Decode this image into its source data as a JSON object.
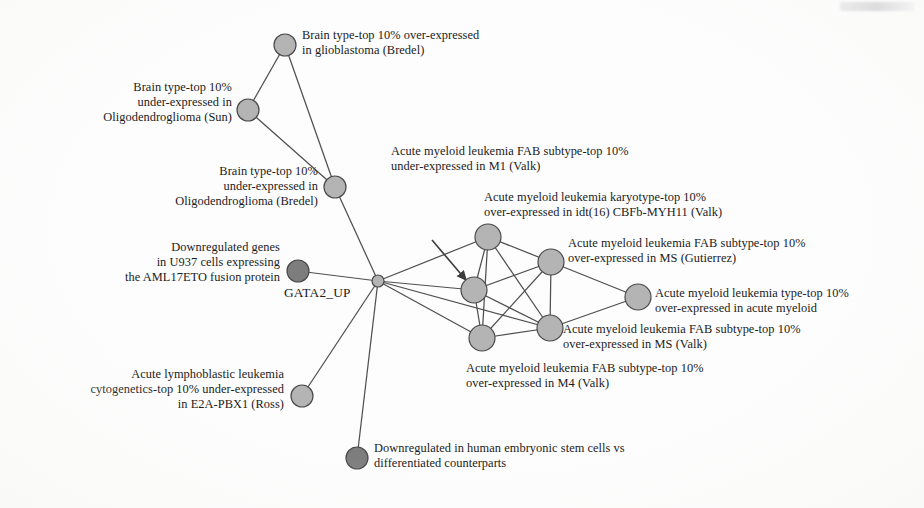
{
  "figure": {
    "type": "network-graph",
    "hub_node_label": "GATA2_UP",
    "colors": {
      "node_light": "#b4b4b4",
      "node_dark": "#7d7d7d",
      "node_stroke": "#4a4a4a",
      "edge": "#4f4f4f",
      "text": "#1b1b1b",
      "background": "#fdfdfd"
    }
  },
  "nodes": [
    {
      "id": "n-glioblastoma-bredel",
      "label": "Brain type-top 10% over-expressed\nin glioblastoma (Bredel)",
      "x": 285,
      "y": 45,
      "r": 11,
      "shade": "light",
      "label_x": 302,
      "label_y": 28,
      "align": "right"
    },
    {
      "id": "n-oligodendroglioma-sun",
      "label": "Brain type-top 10%\nunder-expressed in\nOligodendroglioma (Sun)",
      "x": 248,
      "y": 110,
      "r": 11,
      "shade": "light",
      "label_x": 0,
      "label_y": 80,
      "align": "left",
      "label_w": 232
    },
    {
      "id": "n-oligodendroglioma-bredel",
      "label": "Brain type-top 10%\nunder-expressed in\nOligodendroglioma (Bredel)",
      "x": 335,
      "y": 187,
      "r": 11,
      "shade": "light",
      "label_x": 0,
      "label_y": 164,
      "align": "left",
      "label_w": 318
    },
    {
      "id": "n-aml17eto-u937",
      "label": "Downregulated genes\nin U937 cells expressing\nthe AML17ETO fusion protein",
      "x": 298,
      "y": 271,
      "r": 11,
      "shade": "dark",
      "label_x": 0,
      "label_y": 240,
      "align": "left",
      "label_w": 280
    },
    {
      "id": "n-hub-gata2-up",
      "label": "GATA2_UP",
      "x": 378,
      "y": 281,
      "r": 6,
      "shade": "light",
      "label_x": 284,
      "label_y": 285,
      "align": "hub"
    },
    {
      "id": "n-e2a-pbx1-ross",
      "label": "Acute lymphoblastic leukemia\ncytogenetics-top 10% under-expressed\nin E2A-PBX1 (Ross)",
      "x": 302,
      "y": 396,
      "r": 11,
      "shade": "light",
      "label_x": 0,
      "label_y": 367,
      "align": "left",
      "label_w": 284
    },
    {
      "id": "n-embryonic-stem-cells",
      "label": "Downregulated in human embryonic stem cells vs\ndifferentiated counterparts",
      "x": 357,
      "y": 458,
      "r": 11,
      "shade": "dark",
      "label_x": 374,
      "label_y": 441,
      "align": "right"
    },
    {
      "id": "n-aml-karyotype-cbfb-myh11",
      "label": "Acute myeloid leukemia karyotype-top 10%\nover-expressed in idt(16) CBFb-MYH11 (Valk)",
      "x": 488,
      "y": 237,
      "r": 13,
      "shade": "light",
      "label_x": 484,
      "label_y": 190,
      "align": "right"
    },
    {
      "id": "n-aml-fab-m1-valk",
      "label": "Acute myeloid leukemia FAB subtype-top 10%\nunder-expressed in M1 (Valk)",
      "x": 474,
      "y": 290,
      "r": 13,
      "shade": "light",
      "label_x": 391,
      "label_y": 144,
      "align": "right"
    },
    {
      "id": "n-aml-fab-ms-gutierrez",
      "label": "Acute myeloid leukemia FAB subtype-top 10%\nover-expressed in MS (Gutierrez)",
      "x": 551,
      "y": 262,
      "r": 13,
      "shade": "light",
      "label_x": 568,
      "label_y": 236,
      "align": "right"
    },
    {
      "id": "n-aml-type-acute-myeloid",
      "label": "Acute myeloid leukemia type-top 10%\nover-expressed in acute myeloid",
      "x": 638,
      "y": 297,
      "r": 13,
      "shade": "light",
      "label_x": 655,
      "label_y": 286,
      "align": "right"
    },
    {
      "id": "n-aml-fab-ms-valk",
      "label": "Acute myeloid leukemia FAB subtype-top 10%\nover-expressed in MS (Valk)",
      "x": 550,
      "y": 328,
      "r": 13,
      "shade": "light",
      "label_x": 563,
      "label_y": 322,
      "align": "right"
    },
    {
      "id": "n-aml-fab-m4-valk",
      "label": "Acute myeloid leukemia FAB subtype-top 10%\nover-expressed in M4 (Valk)",
      "x": 482,
      "y": 338,
      "r": 13,
      "shade": "light",
      "label_x": 466,
      "label_y": 361,
      "align": "right"
    }
  ],
  "edges": [
    {
      "from": "n-glioblastoma-bredel",
      "to": "n-oligodendroglioma-sun"
    },
    {
      "from": "n-glioblastoma-bredel",
      "to": "n-oligodendroglioma-bredel"
    },
    {
      "from": "n-oligodendroglioma-sun",
      "to": "n-oligodendroglioma-bredel"
    },
    {
      "from": "n-oligodendroglioma-bredel",
      "to": "n-hub-gata2-up"
    },
    {
      "from": "n-aml17eto-u937",
      "to": "n-hub-gata2-up"
    },
    {
      "from": "n-e2a-pbx1-ross",
      "to": "n-hub-gata2-up"
    },
    {
      "from": "n-embryonic-stem-cells",
      "to": "n-hub-gata2-up"
    },
    {
      "from": "n-hub-gata2-up",
      "to": "n-aml-karyotype-cbfb-myh11"
    },
    {
      "from": "n-hub-gata2-up",
      "to": "n-aml-fab-m1-valk"
    },
    {
      "from": "n-hub-gata2-up",
      "to": "n-aml-fab-m4-valk"
    },
    {
      "from": "n-hub-gata2-up",
      "to": "n-aml-fab-ms-valk"
    },
    {
      "from": "n-aml-karyotype-cbfb-myh11",
      "to": "n-aml-fab-m1-valk"
    },
    {
      "from": "n-aml-karyotype-cbfb-myh11",
      "to": "n-aml-fab-ms-gutierrez"
    },
    {
      "from": "n-aml-karyotype-cbfb-myh11",
      "to": "n-aml-fab-ms-valk"
    },
    {
      "from": "n-aml-karyotype-cbfb-myh11",
      "to": "n-aml-fab-m4-valk"
    },
    {
      "from": "n-aml-fab-m1-valk",
      "to": "n-aml-fab-ms-gutierrez"
    },
    {
      "from": "n-aml-fab-m1-valk",
      "to": "n-aml-fab-ms-valk"
    },
    {
      "from": "n-aml-fab-m1-valk",
      "to": "n-aml-fab-m4-valk"
    },
    {
      "from": "n-aml-fab-ms-gutierrez",
      "to": "n-aml-fab-ms-valk"
    },
    {
      "from": "n-aml-fab-ms-gutierrez",
      "to": "n-aml-type-acute-myeloid"
    },
    {
      "from": "n-aml-fab-ms-gutierrez",
      "to": "n-aml-fab-m4-valk"
    },
    {
      "from": "n-aml-fab-ms-valk",
      "to": "n-aml-fab-m4-valk"
    },
    {
      "from": "n-aml-fab-ms-valk",
      "to": "n-aml-type-acute-myeloid"
    }
  ],
  "annotations": [
    {
      "id": "arrow-to-m1-valk",
      "type": "pointer-arrow",
      "from_x": 432,
      "from_y": 240,
      "to_x": 466,
      "to_y": 280,
      "target": "n-aml-fab-m1-valk"
    }
  ]
}
